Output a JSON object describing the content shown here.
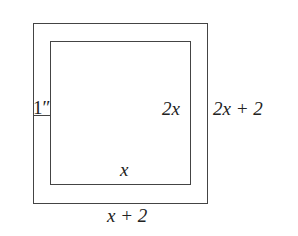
{
  "diagram": {
    "type": "framed-rectangle",
    "labels": {
      "border_width": "1″",
      "inner_height": "2x",
      "outer_height": "2x + 2",
      "inner_width": "x",
      "outer_width": "x + 2"
    },
    "colors": {
      "stroke": "#444444",
      "text": "#222222",
      "background": "#ffffff"
    }
  }
}
